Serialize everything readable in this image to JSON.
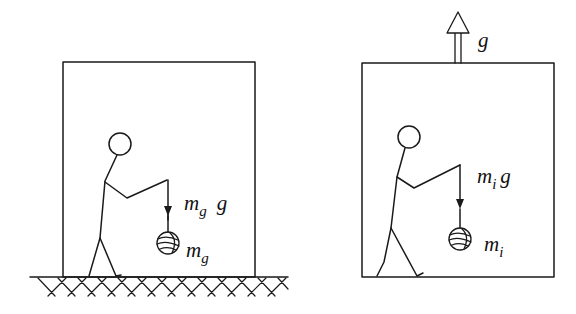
{
  "figure": {
    "panels": [
      {
        "id": "ground",
        "description": "Person in box resting on ground, holding ball under gravity",
        "force_label": {
          "mass": "m",
          "mass_sub": "g",
          "accel": "g"
        },
        "mass_label": {
          "mass": "m",
          "mass_sub": "g"
        },
        "has_ground": true
      },
      {
        "id": "accelerating",
        "description": "Person in box accelerating upward with acceleration g",
        "accel_label": "g",
        "force_label": {
          "mass": "m",
          "mass_sub": "i",
          "accel": "g"
        },
        "mass_label": {
          "mass": "m",
          "mass_sub": "i"
        },
        "has_ground": false
      }
    ]
  },
  "colors": {
    "stroke": "#1a1a1a",
    "background": "#ffffff"
  }
}
